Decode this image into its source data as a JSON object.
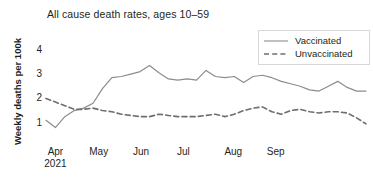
{
  "chart_data": {
    "type": "line",
    "title": "All cause death rates, ages 10–59",
    "xlabel": "",
    "ylabel": "Weekly deaths per 100k",
    "ylim": [
      0,
      4.45
    ],
    "xlim": [
      0,
      27
    ],
    "grid": false,
    "legend_position": "top-right",
    "yticks": [
      1,
      2,
      3,
      4
    ],
    "ytick_labels": [
      "1",
      "2",
      "3",
      "4"
    ],
    "xticks": [
      1,
      5.6,
      10.1,
      14.6,
      19.9,
      24.4
    ],
    "xtick_labels": [
      "Apr",
      "May",
      "Jun",
      "Jul",
      "Aug",
      "Sep"
    ],
    "xtick_sublabels": [
      "2021",
      "",
      "",
      "",
      "",
      ""
    ],
    "x": [
      0,
      1,
      2,
      3,
      4,
      5,
      6,
      7,
      8,
      9,
      10,
      11,
      12,
      13,
      14,
      15,
      16,
      17,
      18,
      19,
      20,
      21,
      22,
      23,
      24,
      25,
      26,
      27
    ],
    "series": [
      {
        "name": "Vaccinated",
        "style": "solid",
        "color": "#8c8c8c",
        "values": [
          1.05,
          0.75,
          1.2,
          1.45,
          1.55,
          1.75,
          2.35,
          2.8,
          2.85,
          2.95,
          3.05,
          3.3,
          3.0,
          2.75,
          2.7,
          2.75,
          2.7,
          3.1,
          2.85,
          2.8,
          2.85,
          2.6,
          2.85,
          2.9,
          2.8,
          2.65,
          2.55,
          2.45
        ]
      },
      {
        "name": "Unvaccinated",
        "style": "dashed",
        "color": "#6e6e6e",
        "values": [
          1.95,
          1.8,
          1.65,
          1.5,
          1.5,
          1.55,
          1.45,
          1.4,
          1.3,
          1.25,
          1.2,
          1.2,
          1.3,
          1.25,
          1.2,
          1.2,
          1.2,
          1.25,
          1.3,
          1.2,
          1.3,
          1.45,
          1.55,
          1.6,
          1.4,
          1.3,
          1.45,
          1.5
        ]
      }
    ],
    "series_tail": {
      "Vaccinated": [
        2.3,
        2.25,
        2.45,
        2.65,
        2.4,
        2.25,
        2.25
      ],
      "Unvaccinated": [
        1.4,
        1.35,
        1.4,
        1.4,
        1.35,
        1.15,
        0.9
      ]
    }
  }
}
